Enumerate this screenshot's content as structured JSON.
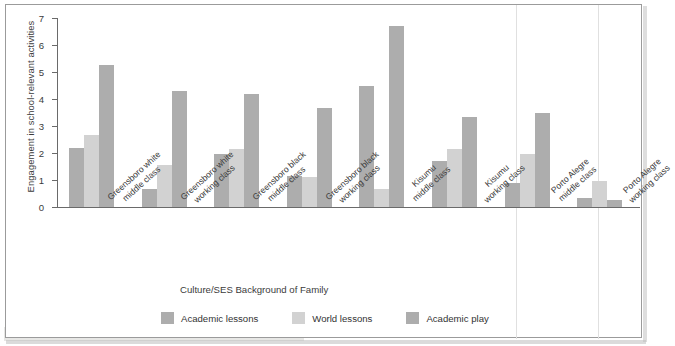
{
  "chart_data": {
    "type": "bar",
    "title": "",
    "xlabel": "Culture/SES Background of Family",
    "ylabel": "Engagement in school-relevant activities",
    "ylim": [
      0,
      7
    ],
    "yticks": [
      "0",
      "1",
      "2",
      "3",
      "4",
      "5",
      "6",
      "7"
    ],
    "grid": false,
    "legend_position": "bottom",
    "categories": [
      "Greensboro white\nmiddle class",
      "Greensboro white\nworking class",
      "Greensboro black\nmiddle class",
      "Greensboro black\nworking class",
      "Kisumu\nmiddle class",
      "Kisumu\nworking class",
      "Porto Alegre\nmiddle class",
      "Porto Alegre\nworking class"
    ],
    "category_lines": [
      [
        "Greensboro white",
        "middle class"
      ],
      [
        "Greensboro white",
        "working class"
      ],
      [
        "Greensboro black",
        "middle class"
      ],
      [
        "Greensboro black",
        "working class"
      ],
      [
        "Kisumu",
        "middle class"
      ],
      [
        "Kisumu",
        "working class"
      ],
      [
        "Porto Alegre",
        "middle class"
      ],
      [
        "Porto Alegre",
        "working class"
      ]
    ],
    "series": [
      {
        "name": "Academic lessons",
        "color": "#adadad",
        "values": [
          2.2,
          0.65,
          1.95,
          1.15,
          4.5,
          1.7,
          0.9,
          0.35
        ]
      },
      {
        "name": "World lessons",
        "color": "#d2d2d2",
        "values": [
          2.65,
          1.55,
          2.15,
          1.1,
          0.65,
          2.15,
          1.95,
          0.95
        ]
      },
      {
        "name": "Academic play",
        "color": "#adadad",
        "values": [
          5.25,
          4.3,
          4.2,
          3.65,
          6.7,
          3.35,
          3.5,
          0.25
        ]
      }
    ]
  },
  "figure": {
    "border_color": "#9b9b9b",
    "background": "#ffffff",
    "axis_color": "#6a6a6a",
    "text_color": "#3b3b3b"
  }
}
